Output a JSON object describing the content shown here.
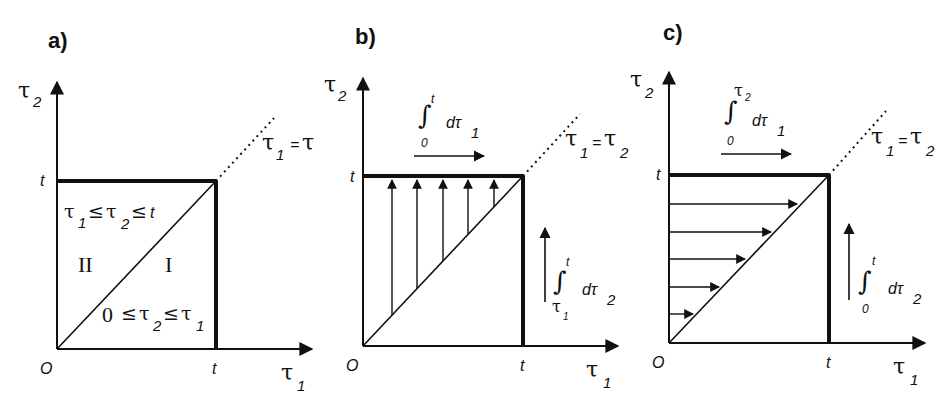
{
  "panels": [
    {
      "id": "a",
      "label": "a)",
      "axes": {
        "x_label": "τ",
        "x_sub": "1",
        "y_label": "τ",
        "y_sub": "2",
        "origin": "O",
        "x_tick": "t",
        "y_tick": "t"
      },
      "diagonal_label": {
        "lhs": "τ",
        "lhs_sub": "1",
        "eq": "=",
        "rhs": "τ",
        "rhs_sub": "2"
      },
      "regions": [
        {
          "name": "II",
          "condition": {
            "a": "τ",
            "a_sub": "1",
            "op1": "≤",
            "b": "τ",
            "b_sub": "2",
            "op2": "≤",
            "c": "t"
          }
        },
        {
          "name": "I",
          "condition": {
            "a": "0",
            "op1": "≤",
            "b": "τ",
            "b_sub": "2",
            "op2": "≤",
            "c": "τ",
            "c_sub": "1"
          }
        }
      ]
    },
    {
      "id": "b",
      "label": "b)",
      "axes": {
        "x_label": "τ",
        "x_sub": "1",
        "y_label": "τ",
        "y_sub": "2",
        "origin": "O",
        "x_tick": "t",
        "y_tick": "t"
      },
      "diagonal_label": {
        "lhs": "τ",
        "lhs_sub": "1",
        "eq": "=",
        "rhs": "τ",
        "rhs_sub": "2"
      },
      "outer_integral": {
        "symbol": "∫",
        "lower": "0",
        "upper": "t",
        "d": "dτ",
        "d_sub": "1"
      },
      "inner_integral": {
        "symbol": "∫",
        "lower": "τ",
        "lower_sub": "1",
        "upper": "t",
        "d": "dτ",
        "d_sub": "2"
      },
      "hatch_direction": "vertical"
    },
    {
      "id": "c",
      "label": "c)",
      "axes": {
        "x_label": "τ",
        "x_sub": "1",
        "y_label": "τ",
        "y_sub": "2",
        "origin": "O",
        "x_tick": "t",
        "y_tick": "t"
      },
      "diagonal_label": {
        "lhs": "τ",
        "lhs_sub": "1",
        "eq": "=",
        "rhs": "τ",
        "rhs_sub": "2"
      },
      "outer_integral": {
        "symbol": "∫",
        "lower": "0",
        "upper": "τ",
        "upper_sub": "2",
        "d": "dτ",
        "d_sub": "1"
      },
      "inner_integral": {
        "symbol": "∫",
        "lower": "0",
        "upper": "t",
        "d": "dτ",
        "d_sub": "2"
      },
      "hatch_direction": "horizontal"
    }
  ],
  "colors": {
    "ink": "#111111",
    "background": "#ffffff"
  }
}
